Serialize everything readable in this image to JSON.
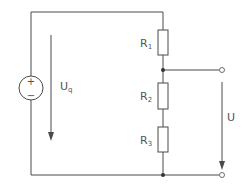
{
  "diagram": {
    "type": "circuit",
    "source": {
      "label_main": "U",
      "label_sub": "q",
      "plus": "+",
      "minus": "−"
    },
    "resistors": [
      {
        "label_main": "R",
        "label_sub": "1"
      },
      {
        "label_main": "R",
        "label_sub": "2"
      },
      {
        "label_main": "R",
        "label_sub": "3"
      }
    ],
    "output": {
      "label": "U"
    },
    "colors": {
      "wire": "#4a4a4a",
      "text": "#555555"
    }
  }
}
